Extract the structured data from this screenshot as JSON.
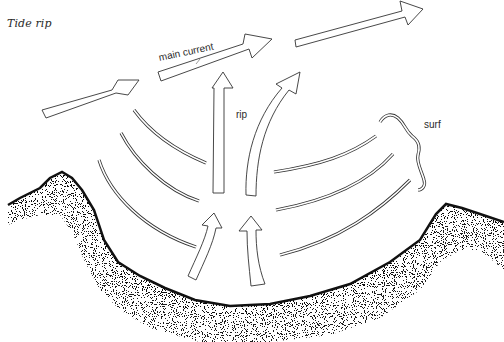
{
  "diagram": {
    "title": "Tide rip",
    "labels": {
      "main_current": "main current",
      "rip": "rip",
      "surf": "surf"
    },
    "elements": {
      "current_arrows": 3,
      "rip_arrows_upper": 2,
      "rip_arrows_lower": 2,
      "wave_lines_left": 3,
      "wave_lines_right": 3,
      "shoreline": "stippled coastline forming a bay"
    },
    "colors": {
      "ink": "#333333",
      "background": "#ffffff",
      "stipple": "#111111"
    }
  }
}
